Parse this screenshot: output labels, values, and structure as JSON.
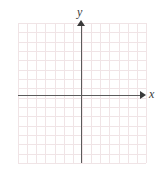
{
  "figure": {
    "type": "coordinate-grid",
    "background_color": "#ffffff"
  },
  "grid": {
    "color": "#f0e4e6",
    "columns": 14,
    "rows": 15,
    "cell_size_px": 9.2,
    "left_px": 18,
    "top_px": 23,
    "width_px": 128,
    "height_px": 140
  },
  "axes": {
    "color": "#5b5b5b",
    "arrow_color": "#3a3a3a",
    "origin": {
      "x_px": 81,
      "y_px": 95
    },
    "x_axis": {
      "label": "x",
      "name": "x-axis",
      "arrow": "right"
    },
    "y_axis": {
      "label": "y",
      "name": "y-axis",
      "arrow": "up"
    }
  },
  "chart_data": {
    "type": "scatter",
    "title": "",
    "subtitle": "",
    "xlabel": "x",
    "ylabel": "y",
    "series": [
      {
        "name": "",
        "x": [],
        "y": []
      }
    ],
    "xlim": [
      -7,
      7
    ],
    "ylim": [
      -7,
      8
    ],
    "xticks": [],
    "yticks": [],
    "grid": true,
    "legend": false,
    "annotations": []
  }
}
